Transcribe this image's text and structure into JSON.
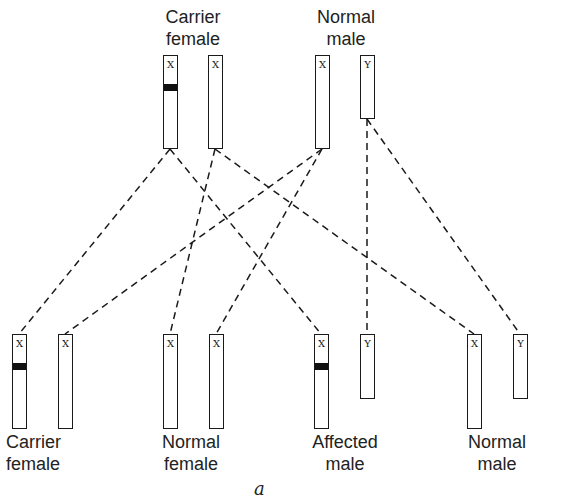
{
  "diagram": {
    "caption": "a",
    "parents": [
      {
        "id": "carrier-female",
        "label_line1": "Carrier",
        "label_line2": "female",
        "chromosomes": [
          {
            "type": "X",
            "mutant_band": true
          },
          {
            "type": "X",
            "mutant_band": false
          }
        ]
      },
      {
        "id": "normal-male",
        "label_line1": "Normal",
        "label_line2": "male",
        "chromosomes": [
          {
            "type": "X",
            "mutant_band": false
          },
          {
            "type": "Y",
            "mutant_band": false
          }
        ]
      }
    ],
    "offspring": [
      {
        "id": "carrier-female",
        "label_line1": "Carrier",
        "label_line2": "female",
        "chromosomes": [
          {
            "type": "X",
            "mutant_band": true
          },
          {
            "type": "X",
            "mutant_band": false
          }
        ]
      },
      {
        "id": "normal-female",
        "label_line1": "Normal",
        "label_line2": "female",
        "chromosomes": [
          {
            "type": "X",
            "mutant_band": false
          },
          {
            "type": "X",
            "mutant_band": false
          }
        ]
      },
      {
        "id": "affected-male",
        "label_line1": "Affected",
        "label_line2": "male",
        "chromosomes": [
          {
            "type": "X",
            "mutant_band": true
          },
          {
            "type": "Y",
            "mutant_band": false
          }
        ]
      },
      {
        "id": "normal-male",
        "label_line1": "Normal",
        "label_line2": "male",
        "chromosomes": [
          {
            "type": "X",
            "mutant_band": false
          },
          {
            "type": "Y",
            "mutant_band": false
          }
        ]
      }
    ],
    "inheritance_links": [
      {
        "from": "mother X (mutant)",
        "to": "carrier female X (mutant)"
      },
      {
        "from": "mother X (mutant)",
        "to": "affected male X (mutant)"
      },
      {
        "from": "mother X (normal)",
        "to": "normal female X"
      },
      {
        "from": "mother X (normal)",
        "to": "normal male X"
      },
      {
        "from": "father X",
        "to": "carrier female X (normal)"
      },
      {
        "from": "father X",
        "to": "normal female X"
      },
      {
        "from": "father Y",
        "to": "affected male Y"
      },
      {
        "from": "father Y",
        "to": "normal male Y"
      }
    ],
    "colors": {
      "line": "#1a1a1a",
      "band": "#111111",
      "background": "#ffffff"
    }
  }
}
